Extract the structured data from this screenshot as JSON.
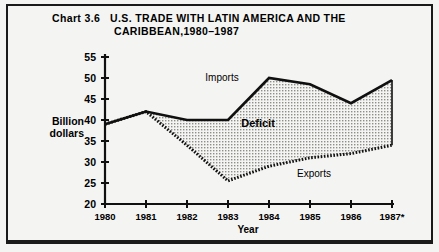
{
  "figure": {
    "title_number": "Chart 3.6",
    "title_line1": "U.S. TRADE WITH LATIN AMERICA AND THE",
    "title_line2": "CARIBBEAN,1980–1987"
  },
  "chart_data": {
    "type": "area",
    "xlabel": "Year",
    "ylabel": "Billion dollars",
    "ylim": [
      20,
      55
    ],
    "ytick_step": 5,
    "yticks": [
      "20",
      "25",
      "30",
      "35",
      "40",
      "45",
      "50",
      "55"
    ],
    "xticks": [
      "1980",
      "1981",
      "1982",
      "1983",
      "1984",
      "1985",
      "1986",
      "1987*"
    ],
    "x": [
      1980,
      1981,
      1982,
      1983,
      1984,
      1985,
      1986,
      1987
    ],
    "grid": false,
    "legend": "inline-annotations",
    "series": [
      {
        "name": "Imports",
        "label": "Imports",
        "style": "solid-thick-black",
        "values": [
          39,
          42,
          40,
          40,
          50,
          48.5,
          44,
          49.5
        ]
      },
      {
        "name": "Exports",
        "label": "Exports",
        "style": "dashed-hatched-black",
        "values": [
          39,
          42,
          34,
          25.5,
          29,
          31,
          32,
          34
        ]
      }
    ],
    "annotations": [
      {
        "text": "Imports",
        "anchor_series": "Imports",
        "position": "above-line-1983"
      },
      {
        "text": "Exports",
        "anchor_series": "Exports",
        "position": "below-line-1985"
      },
      {
        "text": "Deficit",
        "position": "between-series-center",
        "role": "shaded-area-label"
      }
    ],
    "colors": {
      "line": "#101010",
      "fill": "#d0d0cc",
      "background": "#f4f4f2",
      "text": "#000000"
    },
    "footnote_marker": "*"
  }
}
